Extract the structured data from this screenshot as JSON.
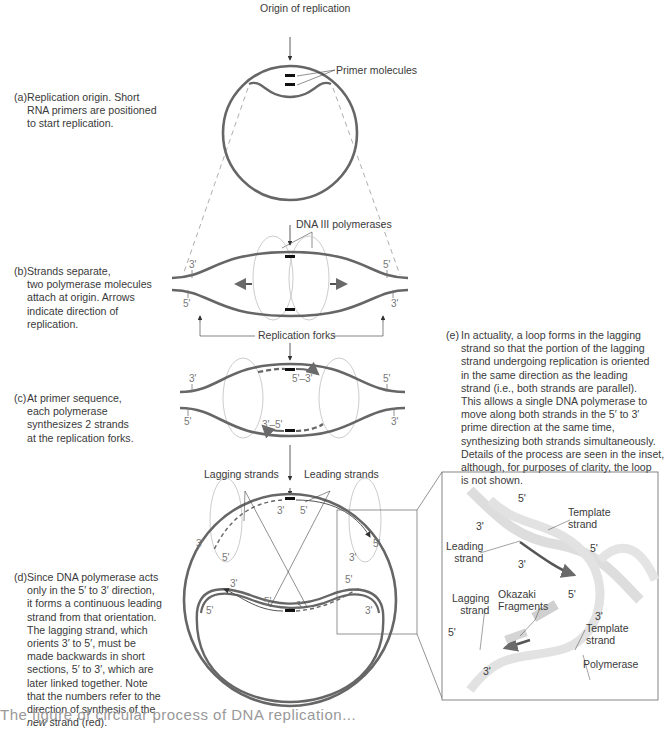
{
  "diagram": {
    "top_label": "Origin of replication",
    "primer_label": "Primer molecules",
    "polymerase_label": "DNA III polymerases",
    "forks_label": "Replication forks",
    "lagging_label": "Lagging strands",
    "leading_label": "Leading strands",
    "stage_b": {
      "top_left": "3'",
      "bottom_left": "5'",
      "top_right": "5'",
      "bottom_right": "3'"
    },
    "stage_c": {
      "top_left": "3'",
      "bottom_left": "5'",
      "top_right": "5'",
      "bottom_right": "3'",
      "upper_dir": "5'–3'",
      "lower_dir": "3'–5'"
    },
    "stage_d": {
      "outer_left_top": "3'",
      "inner_left_top": "5'",
      "inner_left_3": "3'",
      "outer_left_bottom": "5'",
      "center_top_3": "3'",
      "center_top_5": "5'",
      "center_bottom_5": "5'",
      "center_bottom_3": "3'",
      "outer_right_top": "5'",
      "inner_right_3": "3'",
      "inner_right_5": "5'",
      "outer_right_bottom": "3'"
    },
    "inset": {
      "five_top": "5'",
      "three_top": "3'",
      "leading": "Leading\nstrand",
      "three_mid": "3'",
      "template_top": "Template\nstrand",
      "five_right": "5'",
      "okazaki": "Okazaki\nFragments",
      "five_mid": "5'",
      "three_right": "3'",
      "lagging": "Lagging\nstrand",
      "five_bl": "5'",
      "three_bl": "3'",
      "template_bottom": "Template\nstrand",
      "polymerase": "Polymerase"
    }
  },
  "captions": {
    "a": {
      "label": "(a)",
      "text": "Replication origin. Short\nRNA primers are positioned\nto start replication."
    },
    "b": {
      "label": "(b)",
      "text": "Strands separate,\ntwo polymerase molecules\nattach at origin. Arrows\nindicate direction of\nreplication."
    },
    "c": {
      "label": "(c)",
      "text": "At primer sequence,\neach polymerase\nsynthesizes 2 strands\nat the replication forks."
    },
    "d": {
      "label": "(d)",
      "text_main": "Since DNA polymerase acts\nonly in the 5′ to 3′ direction,\nit forms a continuous leading\nstrand from that orientation.\nThe lagging strand, which\norients 3′ to 5′, must be\nmade backwards in short\nsections, 5′ to 3′, which are\nlater linked together. Note\nthat the numbers refer to the\ndirection of synthesis of the\n",
      "text_em": "new",
      "text_end": " strand (red)."
    },
    "e": {
      "label": "(e)",
      "text": "In actuality, a loop forms in the lagging\nstrand so that the portion of the lagging\nstrand undergoing replication is oriented\nin the same direction as the leading\nstrand (i.e., both strands are parallel).\nThis allows a single DNA polymerase to\nmove along both strands in the 5′ to 3′\nprime direction at the same time,\nsynthesizing both strands simultaneously.\nDetails of the process are seen in the inset,\nalthough, for purposes of clarity, the loop\nis not shown."
    }
  },
  "bottom_text": "The figure of circular process of DNA replication..."
}
